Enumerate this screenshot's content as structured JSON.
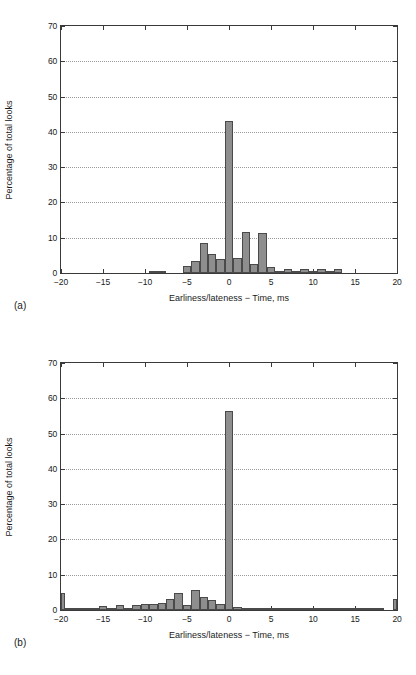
{
  "figure": {
    "caption": "",
    "bar_color": "#8e8e8e",
    "bar_edge_color": "#4a4a4a",
    "axis_color": "#3a3a3a",
    "grid_color": "#9a9a9a",
    "background": "#ffffff"
  },
  "chart_data": [
    {
      "type": "bar",
      "panel": "(a)",
      "title": "",
      "xlabel": "Earliness/lateness − Time, ms",
      "ylabel": "Percentage of total looks",
      "xlim": [
        -20,
        20
      ],
      "ylim": [
        0,
        70
      ],
      "xticks": [
        -20,
        -15,
        -10,
        -5,
        0,
        5,
        10,
        15,
        20
      ],
      "xticklabels": [
        "−20",
        "−15",
        "−10",
        "−5",
        "0",
        "5",
        "10",
        "15",
        "20"
      ],
      "yticks": [
        0,
        10,
        20,
        30,
        40,
        50,
        60,
        70
      ],
      "yticklabels": [
        "0",
        "10",
        "20",
        "30",
        "40",
        "50",
        "60",
        "70"
      ],
      "grid": "horizontal-dotted",
      "legend": "none",
      "bin_width": 1,
      "x": [
        -20,
        -19,
        -18,
        -17,
        -16,
        -15,
        -14,
        -13,
        -12,
        -11,
        -10,
        -9,
        -8,
        -7,
        -6,
        -5,
        -4,
        -3,
        -2,
        -1,
        0,
        1,
        2,
        3,
        4,
        5,
        6,
        7,
        8,
        9,
        10,
        11,
        12,
        13,
        14,
        15,
        16,
        17,
        18,
        19,
        20
      ],
      "values": [
        0,
        0,
        0,
        0,
        0,
        0,
        0,
        0,
        0,
        0,
        0,
        0.3,
        0.2,
        0,
        0,
        1.9,
        3.4,
        8.5,
        5.4,
        4.1,
        43.0,
        4.2,
        11.7,
        2.6,
        11.2,
        1.6,
        0.7,
        1.0,
        0.2,
        1.1,
        0.3,
        1.1,
        0.1,
        1.2,
        0,
        0,
        0,
        0,
        0,
        0,
        0
      ]
    },
    {
      "type": "bar",
      "panel": "(b)",
      "title": "",
      "xlabel": "Earliness/lateness − Time, ms",
      "ylabel": "Percentage of total looks",
      "xlim": [
        -20,
        20
      ],
      "ylim": [
        0,
        70
      ],
      "xticks": [
        -20,
        -15,
        -10,
        -5,
        0,
        5,
        10,
        15,
        20
      ],
      "xticklabels": [
        "−20",
        "−15",
        "−10",
        "−5",
        "0",
        "5",
        "10",
        "15",
        "20"
      ],
      "yticks": [
        0,
        10,
        20,
        30,
        40,
        50,
        60,
        70
      ],
      "yticklabels": [
        "0",
        "10",
        "20",
        "30",
        "40",
        "50",
        "60",
        "70"
      ],
      "grid": "horizontal-dotted",
      "legend": "none",
      "bin_width": 1,
      "x": [
        -20,
        -19,
        -18,
        -17,
        -16,
        -15,
        -14,
        -13,
        -12,
        -11,
        -10,
        -9,
        -8,
        -7,
        -6,
        -5,
        -4,
        -3,
        -2,
        -1,
        0,
        1,
        2,
        3,
        4,
        5,
        6,
        7,
        8,
        9,
        10,
        11,
        12,
        13,
        14,
        15,
        16,
        17,
        18,
        19,
        20
      ],
      "values": [
        4.7,
        0.6,
        0.2,
        0.2,
        0.5,
        1.0,
        0.3,
        1.3,
        0.2,
        1.4,
        1.7,
        1.8,
        2.1,
        3.1,
        4.9,
        1.4,
        5.8,
        3.7,
        2.9,
        1.7,
        56.5,
        0.8,
        0.5,
        0.2,
        0.3,
        0.2,
        0.1,
        0.1,
        0.2,
        0.3,
        0.4,
        0.5,
        0.6,
        0.3,
        0.2,
        0.3,
        0.7,
        0.6,
        0.1,
        0.0,
        3.2
      ]
    }
  ]
}
